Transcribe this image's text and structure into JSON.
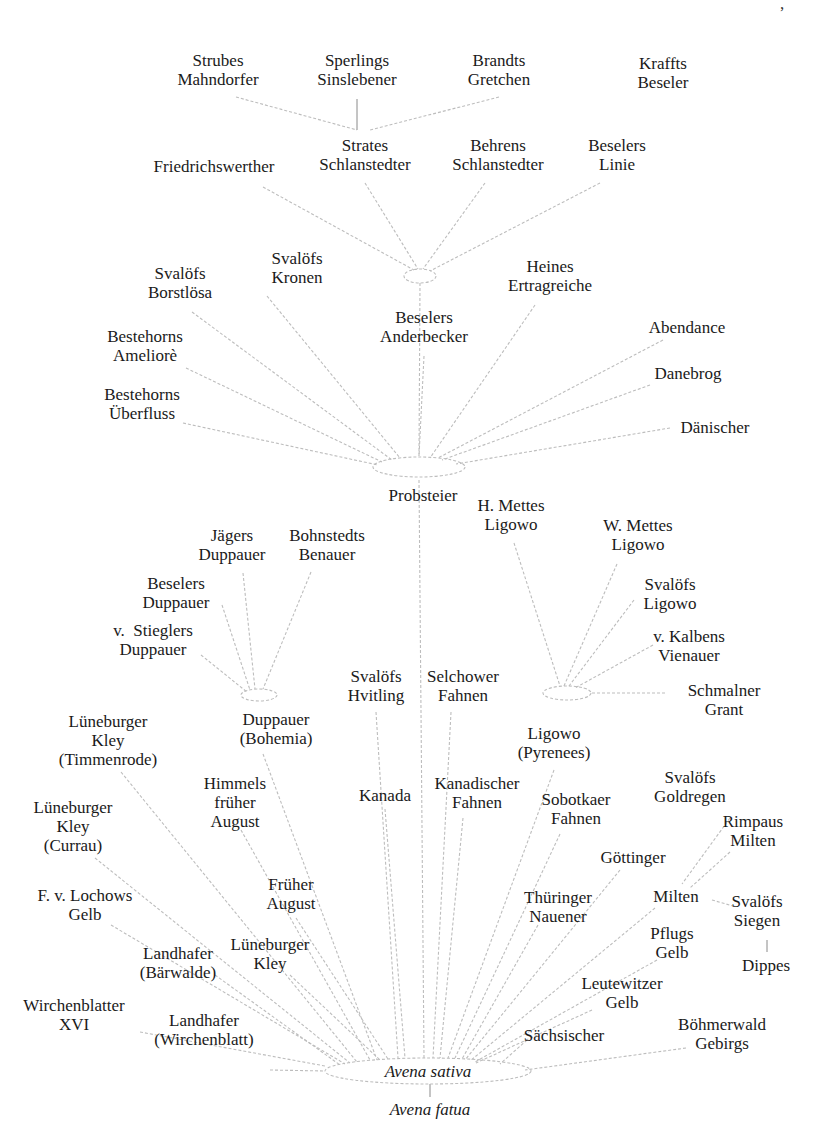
{
  "diagram": {
    "type": "genealogy-tree",
    "root": "Avena sativa",
    "line_color": "#bdbdbd",
    "text_color": "#1a1a1a",
    "hubs": [
      {
        "id": "hub-top",
        "cx": 420,
        "cy": 276,
        "rx": 16,
        "ry": 7
      },
      {
        "id": "hub-probsteier",
        "cx": 419,
        "cy": 467,
        "rx": 46,
        "ry": 10
      },
      {
        "id": "hub-duppauer",
        "cx": 259,
        "cy": 695,
        "rx": 18,
        "ry": 6
      },
      {
        "id": "hub-ligowo",
        "cx": 567,
        "cy": 693,
        "rx": 24,
        "ry": 7
      },
      {
        "id": "hub-sativa",
        "cx": 428,
        "cy": 1071,
        "rx": 103,
        "ry": 13
      }
    ],
    "nodes": [
      {
        "id": "strubes",
        "label": "Strubes\nMahndorfer",
        "x": 218,
        "y": 70
      },
      {
        "id": "sperlings",
        "label": "Sperlings\nSinslebener",
        "x": 357,
        "y": 70
      },
      {
        "id": "brandts",
        "label": "Brandts\nGretchen",
        "x": 499,
        "y": 70
      },
      {
        "id": "kraffts",
        "label": "Kraffts\nBeseler",
        "x": 663,
        "y": 73
      },
      {
        "id": "friedrichswerther",
        "label": "Friedrichswerther",
        "x": 214,
        "y": 166
      },
      {
        "id": "strates",
        "label": "Strates\nSchlanstedter",
        "x": 365,
        "y": 155
      },
      {
        "id": "behrens",
        "label": "Behrens\nSchlanstedter",
        "x": 498,
        "y": 155
      },
      {
        "id": "beselers-linie",
        "label": "Beselers\nLinie",
        "x": 617,
        "y": 155
      },
      {
        "id": "svalofs-borstlosa",
        "label": "Svalöfs\nBorstlösa",
        "x": 180,
        "y": 283
      },
      {
        "id": "svalofs-kronen",
        "label": "Svalöfs\nKronen",
        "x": 297,
        "y": 268
      },
      {
        "id": "heines",
        "label": "Heines\nErtragreiche",
        "x": 550,
        "y": 276
      },
      {
        "id": "beselers-anderbecker",
        "label": "Beselers\nAnderbecker",
        "x": 424,
        "y": 327
      },
      {
        "id": "abendance",
        "label": "Abendance",
        "x": 687,
        "y": 327
      },
      {
        "id": "bestehorns-ameliore",
        "label": "Bestehorns\nAmeliorè",
        "x": 145,
        "y": 346
      },
      {
        "id": "danebrog",
        "label": "Danebrog",
        "x": 688,
        "y": 373
      },
      {
        "id": "bestehorns-uberfluss",
        "label": "Bestehorns\nÜberfluss",
        "x": 142,
        "y": 404
      },
      {
        "id": "danischer",
        "label": "Dänischer",
        "x": 715,
        "y": 427
      },
      {
        "id": "probsteier",
        "label": "Probsteier",
        "x": 423,
        "y": 495
      },
      {
        "id": "h-mettes",
        "label": "H. Mettes\nLigowo",
        "x": 511,
        "y": 515
      },
      {
        "id": "jagers",
        "label": "Jägers\nDuppauer",
        "x": 232,
        "y": 545
      },
      {
        "id": "bohnstedts",
        "label": "Bohnstedts\nBenauer",
        "x": 327,
        "y": 545
      },
      {
        "id": "w-mettes",
        "label": "W. Mettes\nLigowo",
        "x": 638,
        "y": 535
      },
      {
        "id": "beselers-duppauer",
        "label": "Beselers\nDuppauer",
        "x": 176,
        "y": 593
      },
      {
        "id": "svalofs-ligowo",
        "label": "Svalöfs\nLigowo",
        "x": 670,
        "y": 594
      },
      {
        "id": "v-stieglers",
        "label": "v.  Stieglers\nDuppauer",
        "x": 153,
        "y": 640
      },
      {
        "id": "v-kalbens",
        "label": "v. Kalbens\nVienauer",
        "x": 689,
        "y": 646
      },
      {
        "id": "svalofs-hvitling",
        "label": "Svalöfs\nHvitling",
        "x": 376,
        "y": 686
      },
      {
        "id": "selchower",
        "label": "Selchower\nFahnen",
        "x": 463,
        "y": 686
      },
      {
        "id": "schmalner",
        "label": "Schmalner\nGrant",
        "x": 724,
        "y": 700
      },
      {
        "id": "luneburger-timmenrode",
        "label": "Lüneburger\nKley\n(Timmenrode)",
        "x": 108,
        "y": 740
      },
      {
        "id": "duppauer-bohemia",
        "label": "Duppauer\n(Bohemia)",
        "x": 276,
        "y": 729
      },
      {
        "id": "ligowo-pyrenees",
        "label": "Ligowo\n(Pyrenees)",
        "x": 554,
        "y": 743
      },
      {
        "id": "himmels",
        "label": "Himmels\nfrüher\nAugust",
        "x": 235,
        "y": 802
      },
      {
        "id": "kanada",
        "label": "Kanada",
        "x": 385,
        "y": 795
      },
      {
        "id": "kanadischer",
        "label": "Kanadischer\nFahnen",
        "x": 477,
        "y": 793
      },
      {
        "id": "sobotkaer",
        "label": "Sobotkaer\nFahnen",
        "x": 576,
        "y": 809
      },
      {
        "id": "svalofs-goldregen",
        "label": "Svalöfs\nGoldregen",
        "x": 690,
        "y": 787
      },
      {
        "id": "luneburger-currau",
        "label": "Lüneburger\nKley\n(Currau)",
        "x": 73,
        "y": 826
      },
      {
        "id": "rimpaus",
        "label": "Rimpaus\nMilten",
        "x": 753,
        "y": 831
      },
      {
        "id": "gottinger",
        "label": "Göttinger",
        "x": 633,
        "y": 857
      },
      {
        "id": "fruher-august",
        "label": "Früher\nAugust",
        "x": 291,
        "y": 894
      },
      {
        "id": "f-v-lochows",
        "label": "F. v. Lochows\nGelb",
        "x": 85,
        "y": 905
      },
      {
        "id": "thuringer",
        "label": "Thüringer\nNauener",
        "x": 558,
        "y": 907
      },
      {
        "id": "milten",
        "label": "Milten",
        "x": 676,
        "y": 896
      },
      {
        "id": "svalofs-siegen",
        "label": "Svalöfs\nSiegen",
        "x": 757,
        "y": 911
      },
      {
        "id": "pflugs",
        "label": "Pflugs\nGelb",
        "x": 672,
        "y": 943
      },
      {
        "id": "luneburger-kley",
        "label": "Lüneburger\nKley",
        "x": 270,
        "y": 954
      },
      {
        "id": "landhafer-barwalde",
        "label": "Landhafer\n(Bärwalde)",
        "x": 178,
        "y": 963
      },
      {
        "id": "dippes",
        "label": "Dippes",
        "x": 766,
        "y": 965
      },
      {
        "id": "leutewitzer",
        "label": "Leutewitzer\nGelb",
        "x": 622,
        "y": 993
      },
      {
        "id": "wirchenblatter",
        "label": "Wirchenblatter\nXVI",
        "x": 74,
        "y": 1015
      },
      {
        "id": "landhafer-wirchenblatt",
        "label": "Landhafer\n(Wirchenblatt)",
        "x": 204,
        "y": 1030
      },
      {
        "id": "sachsischer",
        "label": "Sächsischer",
        "x": 564,
        "y": 1035
      },
      {
        "id": "bohmerwald",
        "label": "Böhmerwald\nGebirgs",
        "x": 722,
        "y": 1034
      },
      {
        "id": "avena-sativa",
        "label": "Avena sativa",
        "x": 428,
        "y": 1071,
        "italic": true
      },
      {
        "id": "avena-fatua",
        "label": "Avena fatua",
        "x": 430,
        "y": 1109,
        "italic": true
      }
    ],
    "edges": [
      {
        "from": [
          236,
          97
        ],
        "to": [
          357,
          130
        ],
        "style": "dashed"
      },
      {
        "from": [
          357,
          99
        ],
        "to": [
          357,
          130
        ],
        "style": "solid"
      },
      {
        "from": [
          499,
          97
        ],
        "to": [
          370,
          130
        ],
        "style": "dashed"
      },
      {
        "from": [
          263,
          187
        ],
        "to": [
          414,
          270
        ],
        "style": "dashed"
      },
      {
        "from": [
          365,
          183
        ],
        "to": [
          418,
          269
        ],
        "style": "dashed"
      },
      {
        "from": [
          485,
          183
        ],
        "to": [
          423,
          269
        ],
        "style": "dashed"
      },
      {
        "from": [
          600,
          183
        ],
        "to": [
          430,
          271
        ],
        "style": "dashed"
      },
      {
        "from": [
          420,
          283
        ],
        "to": [
          419,
          457
        ],
        "style": "dashed"
      },
      {
        "from": [
          192,
          312
        ],
        "to": [
          392,
          460
        ],
        "style": "dashed"
      },
      {
        "from": [
          267,
          296
        ],
        "to": [
          400,
          458
        ],
        "style": "dashed"
      },
      {
        "from": [
          424,
          356
        ],
        "to": [
          419,
          456
        ],
        "style": "dashed"
      },
      {
        "from": [
          535,
          305
        ],
        "to": [
          430,
          458
        ],
        "style": "dashed"
      },
      {
        "from": [
          663,
          340
        ],
        "to": [
          438,
          458
        ],
        "style": "dashed"
      },
      {
        "from": [
          650,
          385
        ],
        "to": [
          442,
          460
        ],
        "style": "dashed"
      },
      {
        "from": [
          186,
          368
        ],
        "to": [
          382,
          462
        ],
        "style": "dashed"
      },
      {
        "from": [
          183,
          423
        ],
        "to": [
          378,
          465
        ],
        "style": "dashed"
      },
      {
        "from": [
          670,
          428
        ],
        "to": [
          456,
          464
        ],
        "style": "dashed"
      },
      {
        "from": [
          243,
          573
        ],
        "to": [
          255,
          689
        ],
        "style": "dashed"
      },
      {
        "from": [
          311,
          572
        ],
        "to": [
          263,
          689
        ],
        "style": "dashed"
      },
      {
        "from": [
          222,
          605
        ],
        "to": [
          250,
          690
        ],
        "style": "dashed"
      },
      {
        "from": [
          201,
          655
        ],
        "to": [
          247,
          692
        ],
        "style": "dashed"
      },
      {
        "from": [
          514,
          543
        ],
        "to": [
          560,
          686
        ],
        "style": "dashed"
      },
      {
        "from": [
          617,
          564
        ],
        "to": [
          564,
          686
        ],
        "style": "dashed"
      },
      {
        "from": [
          634,
          600
        ],
        "to": [
          569,
          686
        ],
        "style": "dashed"
      },
      {
        "from": [
          653,
          645
        ],
        "to": [
          575,
          688
        ],
        "style": "dashed"
      },
      {
        "from": [
          665,
          693
        ],
        "to": [
          591,
          693
        ],
        "style": "dashed"
      },
      {
        "from": [
          419,
          480
        ],
        "to": [
          424,
          1058
        ],
        "style": "dashed"
      },
      {
        "from": [
          376,
          712
        ],
        "to": [
          398,
          1058
        ],
        "style": "dashed"
      },
      {
        "from": [
          451,
          712
        ],
        "to": [
          433,
          1058
        ],
        "style": "dashed"
      },
      {
        "from": [
          263,
          754
        ],
        "to": [
          377,
          1060
        ],
        "style": "dashed"
      },
      {
        "from": [
          121,
          772
        ],
        "to": [
          357,
          1062
        ],
        "style": "dashed"
      },
      {
        "from": [
          554,
          770
        ],
        "to": [
          448,
          1058
        ],
        "style": "dashed"
      },
      {
        "from": [
          241,
          830
        ],
        "to": [
          370,
          1060
        ],
        "style": "dashed"
      },
      {
        "from": [
          385,
          809
        ],
        "to": [
          405,
          1058
        ],
        "style": "dashed"
      },
      {
        "from": [
          463,
          818
        ],
        "to": [
          440,
          1058
        ],
        "style": "dashed"
      },
      {
        "from": [
          560,
          834
        ],
        "to": [
          455,
          1058
        ],
        "style": "dashed"
      },
      {
        "from": [
          95,
          858
        ],
        "to": [
          350,
          1063
        ],
        "style": "dashed"
      },
      {
        "from": [
          296,
          918
        ],
        "to": [
          388,
          1059
        ],
        "style": "dashed"
      },
      {
        "from": [
          111,
          925
        ],
        "to": [
          345,
          1064
        ],
        "style": "dashed"
      },
      {
        "from": [
          215,
          975
        ],
        "to": [
          340,
          1065
        ],
        "style": "dashed"
      },
      {
        "from": [
          290,
          975
        ],
        "to": [
          380,
          1060
        ],
        "style": "dashed"
      },
      {
        "from": [
          538,
          925
        ],
        "to": [
          462,
          1059
        ],
        "style": "dashed"
      },
      {
        "from": [
          620,
          870
        ],
        "to": [
          465,
          1060
        ],
        "style": "dashed"
      },
      {
        "from": [
          730,
          852
        ],
        "to": [
          690,
          888
        ],
        "style": "dashed"
      },
      {
        "from": [
          730,
          818
        ],
        "to": [
          682,
          884
        ],
        "style": "dashed"
      },
      {
        "from": [
          712,
          900
        ],
        "to": [
          733,
          906
        ],
        "style": "dashed"
      },
      {
        "from": [
          767,
          940
        ],
        "to": [
          767,
          952
        ],
        "style": "solid"
      },
      {
        "from": [
          655,
          908
        ],
        "to": [
          470,
          1061
        ],
        "style": "dashed"
      },
      {
        "from": [
          657,
          960
        ],
        "to": [
          475,
          1062
        ],
        "style": "dashed"
      },
      {
        "from": [
          592,
          1010
        ],
        "to": [
          476,
          1063
        ],
        "style": "dashed"
      },
      {
        "from": [
          527,
          1040
        ],
        "to": [
          500,
          1064
        ],
        "style": "dashed"
      },
      {
        "from": [
          686,
          1048
        ],
        "to": [
          525,
          1070
        ],
        "style": "dashed"
      },
      {
        "from": [
          140,
          1032
        ],
        "to": [
          325,
          1066
        ],
        "style": "dashed"
      },
      {
        "from": [
          270,
          1070
        ],
        "to": [
          325,
          1071
        ],
        "style": "dashed"
      },
      {
        "from": [
          430,
          1084
        ],
        "to": [
          430,
          1097
        ],
        "style": "solid"
      }
    ]
  }
}
